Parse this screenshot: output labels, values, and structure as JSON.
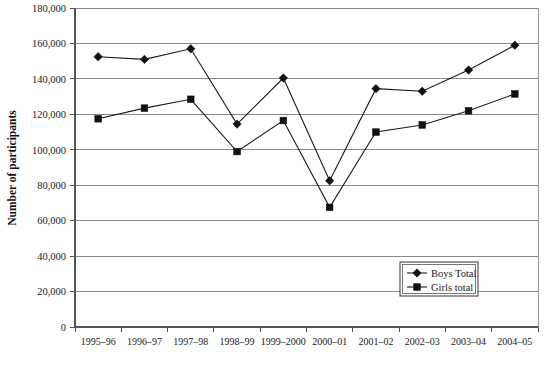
{
  "chart_data": {
    "type": "line",
    "title": "",
    "xlabel": "",
    "ylabel": "Number of participants",
    "categories": [
      "1995–96",
      "1996–97",
      "1997–98",
      "1998–99",
      "1999–2000",
      "2000–01",
      "2001–02",
      "2002–03",
      "2003–04",
      "2004–05"
    ],
    "series": [
      {
        "name": "Boys Total",
        "marker": "diamond",
        "values": [
          152500,
          151000,
          157000,
          114500,
          140500,
          82500,
          134500,
          133000,
          145000,
          159000
        ]
      },
      {
        "name": "Girls total",
        "marker": "square",
        "values": [
          117500,
          123500,
          128500,
          99000,
          116500,
          67500,
          110000,
          114000,
          122000,
          131500
        ]
      }
    ],
    "ylim": [
      0,
      180000
    ],
    "yticks": [
      0,
      20000,
      40000,
      60000,
      80000,
      100000,
      120000,
      140000,
      160000,
      180000
    ],
    "ytick_labels": [
      "0",
      "20,000",
      "40,000",
      "60,000",
      "80,000",
      "100,000",
      "120,000",
      "140,000",
      "160,000",
      "180,000"
    ],
    "grid": true,
    "grid_axis": "y",
    "legend_position": "lower-right",
    "colors": {
      "series_stroke": "#1a1a1a",
      "marker_fill": "#111111",
      "gridline": "#8a8a8a",
      "axis": "#555555",
      "background": "#ffffff"
    }
  },
  "legend": {
    "entries": [
      {
        "label": "Boys Total",
        "marker": "diamond-marker-icon"
      },
      {
        "label": "Girls total",
        "marker": "square-marker-icon"
      }
    ]
  }
}
